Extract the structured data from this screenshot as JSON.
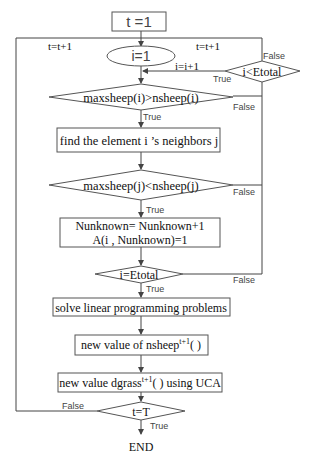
{
  "diagram": {
    "type": "flowchart",
    "nodes": {
      "start": {
        "label": "t =1",
        "shape": "rectangle"
      },
      "init_i": {
        "label": "i=1",
        "shape": "ellipse"
      },
      "cond_i_lt": {
        "label": "i<Etotal",
        "shape": "diamond"
      },
      "cond_max_i": {
        "label": "maxsheep(i)>nsheep(i)",
        "shape": "diamond"
      },
      "find": {
        "label": "find the element i ’s neighbors j",
        "shape": "rectangle"
      },
      "cond_max_j": {
        "label": "maxsheep(j)<nsheep(j)",
        "shape": "diamond"
      },
      "update": {
        "line1": "Nunknown= Nunknown+1",
        "line2": "A(i , Nunknown)=1",
        "shape": "rectangle"
      },
      "cond_i_eq": {
        "label": "i=Etotal",
        "shape": "diamond"
      },
      "solve": {
        "label": "solve linear programming problems",
        "shape": "rectangle"
      },
      "nsheep": {
        "prefix": "new value of nsheep",
        "sup": "t+1",
        "suffix": "( )",
        "shape": "rectangle"
      },
      "dgrass": {
        "prefix": "new value dgrass",
        "sup": "t+1",
        "suffix": "( ) using UCA",
        "shape": "rectangle"
      },
      "cond_t": {
        "label": "t=T",
        "shape": "diamond"
      },
      "end": {
        "label": "END",
        "shape": "terminal-text"
      }
    },
    "edge_labels": {
      "t_inc_left": "t=t+1",
      "t_inc_right": "t=t+1",
      "i_inc": "i=i+1",
      "cond_i_lt_false": "False",
      "cond_i_lt_true": "True",
      "cond_max_i_false": "False",
      "cond_max_i_true": "True",
      "cond_max_j_false": "False",
      "cond_max_j_true": "True",
      "cond_i_eq_false": "False",
      "cond_i_eq_true": "True",
      "cond_t_false": "False",
      "cond_t_true": "True"
    }
  }
}
